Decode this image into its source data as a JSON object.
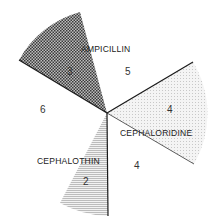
{
  "diagram": {
    "type": "radial-wedge-diagram",
    "center": [
      107,
      113
    ],
    "sectors": [
      {
        "id": "ampicillin",
        "label": "AMPICILLIN",
        "count": "3",
        "pattern": "dark-crosshatch"
      },
      {
        "id": "cephaloridine",
        "label": "CEPHALORIDINE",
        "count": "4",
        "pattern": "light-dots"
      },
      {
        "id": "cephalothin",
        "label": "CEPHALOTHIN",
        "count": "2",
        "pattern": "horizontal-lines"
      }
    ],
    "gap_counts": {
      "between_ampicillin_cephaloridine": "5",
      "between_cephaloridine_cephalothin": "4",
      "between_cephalothin_ampicillin": "6"
    },
    "colors": {
      "line": "#1a1a1a",
      "dark_fill": "#555555",
      "light_fill": "#dcdcdc",
      "hatch": "#888888"
    }
  }
}
